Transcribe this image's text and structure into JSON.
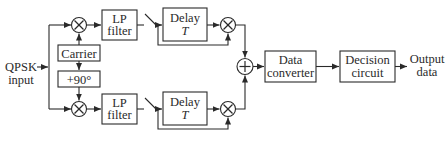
{
  "diagram": {
    "title": "",
    "input": {
      "line1": "QPSK",
      "line2": "input"
    },
    "carrier": "Carrier",
    "phase_shift": "+90°",
    "lp_filter_top": {
      "line1": "LP",
      "line2": "filter"
    },
    "lp_filter_bottom": {
      "line1": "LP",
      "line2": "filter"
    },
    "delay_top": {
      "line1": "Delay",
      "line2": "T"
    },
    "delay_bottom": {
      "line1": "Delay",
      "line2": "T"
    },
    "data_converter": {
      "line1": "Data",
      "line2": "converter"
    },
    "decision_circuit": {
      "line1": "Decision",
      "line2": "circuit"
    },
    "output": {
      "line1": "Output",
      "line2": "data"
    },
    "symbols": {
      "multiplier": "multiplier-icon",
      "adder": "adder-icon",
      "switch": "sampling-switch-icon"
    },
    "colors": {
      "line": "#2a2a2a",
      "background": "#ffffff"
    }
  }
}
